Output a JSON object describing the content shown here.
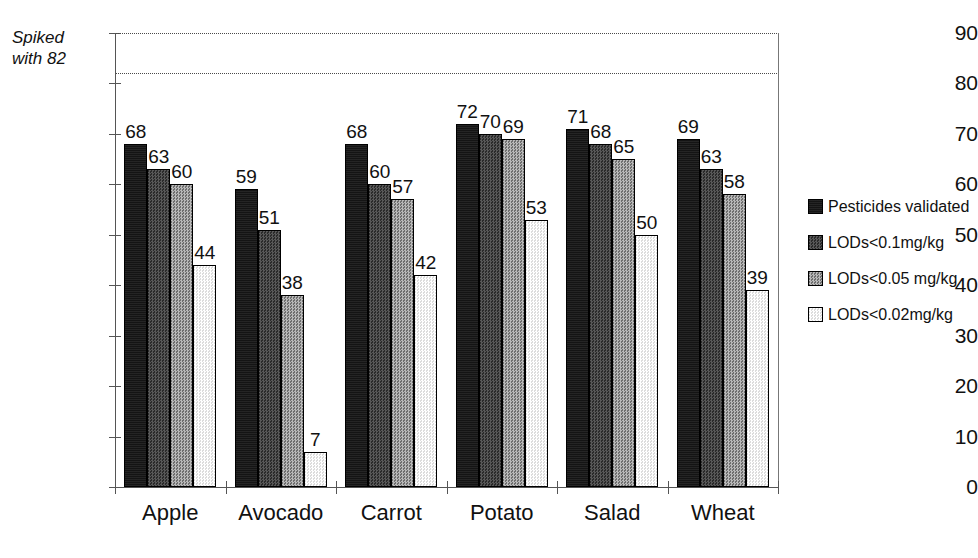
{
  "chart_data": {
    "type": "bar",
    "title": "",
    "subtitle": "",
    "xlabel": "",
    "ylabel": "",
    "ylim": [
      0,
      90
    ],
    "ytick_step": 10,
    "yticks": [
      0,
      10,
      20,
      30,
      40,
      50,
      60,
      70,
      80,
      90
    ],
    "grid": "horizontal-dotted-top-only",
    "legend_position": "right",
    "categories": [
      "Apple",
      "Avocado",
      "Carrot",
      "Potato",
      "Salad",
      "Wheat"
    ],
    "series": [
      {
        "name": "Pesticides validated",
        "color": "#141414",
        "values": [
          68,
          59,
          68,
          72,
          71,
          69
        ]
      },
      {
        "name": "LODs<0.1mg/kg",
        "color": "#3b3b3b",
        "values": [
          63,
          51,
          60,
          70,
          68,
          63
        ]
      },
      {
        "name": "LODs<0.05 mg/kg",
        "color": "#8f8f8f",
        "values": [
          60,
          38,
          57,
          69,
          65,
          58
        ]
      },
      {
        "name": "LODs<0.02mg/kg",
        "color": "#ececec",
        "values": [
          44,
          7,
          42,
          53,
          50,
          39
        ]
      }
    ],
    "annotations": [
      {
        "name": "spiked-reference-line",
        "text": "Spiked with 82",
        "text_line1": "Spiked",
        "text_line2": "with 82",
        "value": 82,
        "style": "dotted"
      }
    ]
  },
  "legend": {
    "items": [
      {
        "label": "Pesticides validated",
        "swatch": "fill-0"
      },
      {
        "label": "LODs<0.1mg/kg",
        "swatch": "fill-1"
      },
      {
        "label": "LODs<0.05 mg/kg",
        "swatch": "fill-2"
      },
      {
        "label": "LODs<0.02mg/kg",
        "swatch": "fill-3"
      }
    ]
  }
}
